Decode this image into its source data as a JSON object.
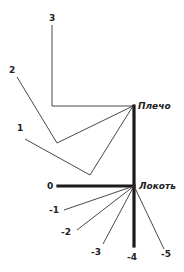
{
  "diagram": {
    "labels": {
      "shoulder": "Плечо",
      "elbow": "Локоть"
    },
    "shoulder_positions": [
      {
        "id": "3",
        "label": "3"
      },
      {
        "id": "2",
        "label": "2"
      },
      {
        "id": "1",
        "label": "1"
      }
    ],
    "elbow_positions": [
      {
        "id": "0",
        "label": "0"
      },
      {
        "id": "-1",
        "label": "-1"
      },
      {
        "id": "-2",
        "label": "-2"
      },
      {
        "id": "-3",
        "label": "-3"
      },
      {
        "id": "-4",
        "label": "-4"
      },
      {
        "id": "-5",
        "label": "-5"
      }
    ],
    "colors": {
      "line": "#333333",
      "thick_line": "#1a1a1a",
      "background": "#ffffff"
    }
  }
}
